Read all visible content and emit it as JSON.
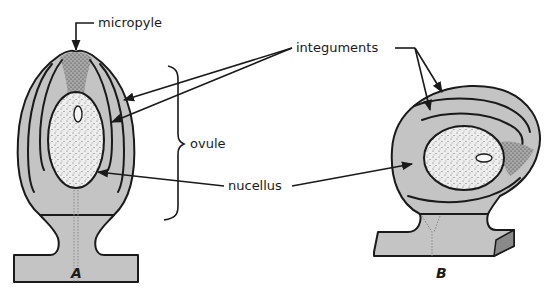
{
  "figure": {
    "panels": [
      {
        "id": "A",
        "label": "A",
        "description": "orthotropous (upright) ovule"
      },
      {
        "id": "B",
        "label": "B",
        "description": "campylotropous (curved) ovule"
      }
    ],
    "labels": {
      "micropyle": "micropyle",
      "integuments": "integuments",
      "ovule": "ovule",
      "nucellus": "nucellus"
    },
    "colors": {
      "tissue": "#c4c4c4",
      "nucellus": "#eeeeee",
      "micropyle_region": "#9a9a9a",
      "outline": "#1a1a1a",
      "background": "#ffffff"
    }
  }
}
